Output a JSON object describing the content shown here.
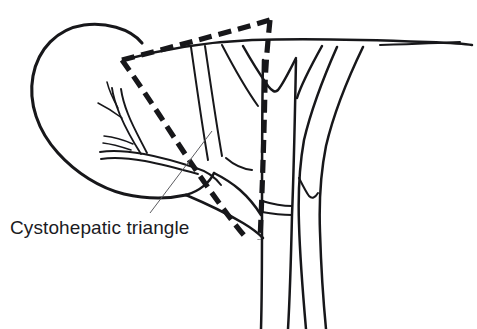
{
  "figure": {
    "kind": "anatomical-line-drawing",
    "background_color": "#ffffff",
    "ink_color": "#17171a",
    "leader_color": "#5c5c60",
    "width": 477,
    "height": 329
  },
  "labels": {
    "cystohepatic_triangle": "Cystohepatic triangle"
  },
  "annotations": {
    "leader": {
      "from_x": 150,
      "from_y": 213,
      "to_x": 212,
      "to_y": 131
    },
    "caption_x": 10,
    "caption_y": 234
  },
  "structures": {
    "gallbladder": {
      "name": "gallbladder",
      "path": "M 142 43 C 130 28 104 22 84 25 C 57 29 38 49 33 76 C 28 103 38 131 58 153 C 76 173 100 188 124 194 C 146 199 168 199 186 195"
    },
    "gallbladder_neck": {
      "name": "gallbladder-neck",
      "path": "M 186 195 C 200 191 210 182 214 173"
    },
    "cystic_artery_trunk": {
      "name": "cystic-artery-trunk",
      "path": "M 196 168 C 178 162 160 157 144 154 C 127 151 112 150 100 152"
    },
    "cystic_artery_trunk_lower": {
      "name": "cystic-artery-trunk-lower",
      "path": "M 198 174 C 180 169 161 164 145 161 C 128 158 113 157 101 159"
    },
    "cystic_artery_branch_up": {
      "name": "cystic-artery-branch-superior",
      "path": "M 141 154 C 134 143 126 129 120 115 C 116 105 113 96 112 88"
    },
    "cystic_artery_branch_up2": {
      "name": "cystic-artery-branch-superior-2",
      "path": "M 147 153 C 141 141 133 127 128 114 C 124 104 122 96 121 89"
    },
    "cystic_artery_twig_a": {
      "name": "cystic-artery-twig-a",
      "path": "M 122 118 C 114 112 106 107 98 103"
    },
    "cystic_artery_twig_b": {
      "name": "cystic-artery-twig-b",
      "path": "M 118 108 C 113 99 109 90 107 82"
    },
    "cystic_artery_twig_c": {
      "name": "cystic-artery-twig-c",
      "path": "M 133 144 C 124 140 114 137 104 136"
    },
    "cystic_artery_twig_d": {
      "name": "cystic-artery-twig-d",
      "path": "M 131 150 C 122 147 112 144 103 143"
    },
    "cystic_duct_upper": {
      "name": "cystic-duct-upper-wall",
      "path": "M 214 173 C 222 177 232 183 240 190 C 249 198 256 207 261 215"
    },
    "cystic_duct_lower": {
      "name": "cystic-duct-lower-wall",
      "path": "M 186 195 C 205 203 226 213 243 223 C 253 229 259 234 263 238"
    },
    "gallbladder_infundibulum": {
      "name": "infundibulum-fold",
      "path": "M 196 168 C 206 171 215 177 221 185"
    },
    "common_hepatic_duct_left": {
      "name": "common-hepatic-duct-left-wall",
      "path": "M 263 60 C 262 110 262 170 262 220 C 262 260 262 295 261 329"
    },
    "common_hepatic_duct_right": {
      "name": "common-hepatic-duct-right-wall",
      "path": "M 296 60 C 295 110 294 168 292 215 C 291 258 290 295 288 329"
    },
    "left_hepatic_duct": {
      "name": "left-hepatic-duct",
      "path": "M 243 46 C 252 62 261 76 268 86 C 272 91 275 93 278 90 C 283 84 289 72 296 58"
    },
    "left_hepatic_duct_inner": {
      "name": "left-hepatic-duct-inner-wall",
      "path": "M 222 45 C 234 68 248 92 258 106"
    },
    "right_hepatic_duct": {
      "name": "right-hepatic-duct",
      "path": "M 322 46 C 312 64 302 82 297 98"
    },
    "hepatic_artery_left": {
      "name": "hepatic-artery-left-wall",
      "path": "M 337 47 C 325 74 312 106 304 140 C 299 168 298 196 299 224 C 300 258 303 295 306 329"
    },
    "hepatic_artery_right": {
      "name": "hepatic-artery-right-wall",
      "path": "M 363 47 C 348 78 334 112 326 146 C 320 176 319 205 320 232 C 321 265 323 298 326 329"
    },
    "hepatic_artery_branch": {
      "name": "hepatic-artery-branch",
      "path": "M 299 178 C 303 186 306 192 309 196 C 312 199 315 198 318 193"
    },
    "portal_confluence": {
      "name": "portal-confluence-fold",
      "path": "M 262 201 C 272 204 283 206 292 206"
    },
    "portal_confluence_2": {
      "name": "portal-confluence-fold-2",
      "path": "M 262 212 C 273 214 284 215 292 215"
    },
    "liver_edge": {
      "name": "liver-inferior-margin",
      "path": "M 123 60 C 160 50 205 42 252 40 C 310 38 376 40 428 42 C 452 43 466 44 472 45"
    },
    "liver_edge_lower": {
      "name": "liver-margin-underline",
      "path": "M 380 45 C 412 44 441 43 460 42"
    },
    "duct_group_line_a": {
      "name": "accessory-duct-line-a",
      "path": "M 191 47 C 196 82 202 125 208 160"
    },
    "duct_group_line_b": {
      "name": "accessory-duct-line-b",
      "path": "M 205 46 C 210 80 216 122 222 156"
    },
    "duct_group_line_c": {
      "name": "accessory-duct-line-c",
      "path": "M 226 158 C 234 165 243 169 252 170"
    }
  },
  "triangle": {
    "name": "cystohepatic-triangle-outline",
    "vertices": [
      {
        "label": "left-base",
        "x": 122,
        "y": 60
      },
      {
        "label": "apex",
        "x": 270,
        "y": 20
      },
      {
        "label": "bottom",
        "x": 248,
        "y": 240
      }
    ],
    "edges": [
      {
        "name": "triangle-edge-top",
        "path": "M 122 60 C 160 50 215 36 270 20"
      },
      {
        "name": "triangle-edge-right",
        "path": "M 270 20 C 268 40 266 60 265 86 C 264 140 262 196 260 240"
      },
      {
        "name": "triangle-edge-left",
        "path": "M 122 60 C 148 96 175 140 200 176 C 218 202 234 224 248 240"
      }
    ]
  }
}
